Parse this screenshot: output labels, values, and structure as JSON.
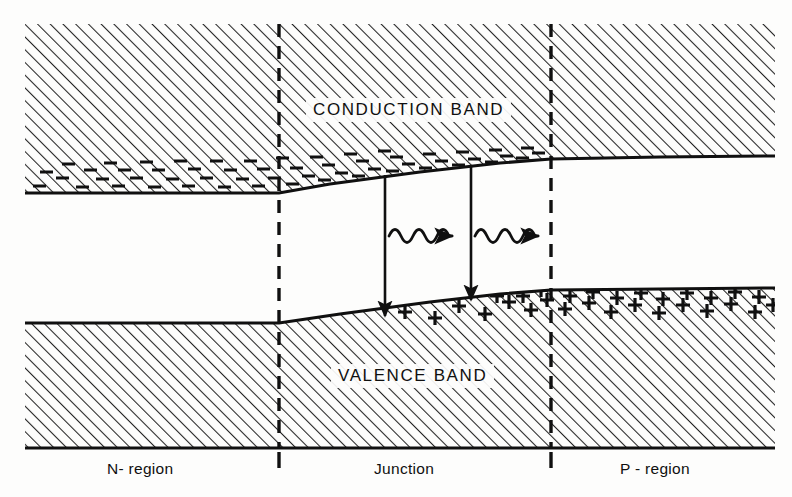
{
  "figure": {
    "type": "band-diagram",
    "canvas": {
      "width": 792,
      "height": 497
    },
    "colors": {
      "background": "#fdfdfc",
      "ink": "#101010",
      "hatch": "#2b2b2b"
    }
  },
  "labels": {
    "conduction_band": "CONDUCTION BAND",
    "valence_band": "VALENCE BAND",
    "n_region": "N- region",
    "junction": "Junction",
    "p_region": "P - region"
  },
  "diagram_data": {
    "type": "band-diagram",
    "x_bounds": [
      25,
      775
    ],
    "boundaries": {
      "n_junction_x": 279,
      "junction_p_x": 551
    },
    "conduction_band": {
      "fill": "hatched",
      "top_y": 24,
      "edge_points": [
        [
          25,
          193
        ],
        [
          279,
          193
        ],
        [
          330,
          184
        ],
        [
          420,
          172
        ],
        [
          500,
          163
        ],
        [
          551,
          159
        ],
        [
          660,
          157
        ],
        [
          775,
          156
        ]
      ],
      "carrier_symbol": "minus",
      "carrier_name": "electrons",
      "carrier_count": 74
    },
    "valence_band": {
      "fill": "hatched",
      "bottom_y": 448,
      "edge_points": [
        [
          25,
          323
        ],
        [
          279,
          323
        ],
        [
          340,
          314
        ],
        [
          430,
          302
        ],
        [
          500,
          294
        ],
        [
          551,
          290
        ],
        [
          660,
          289
        ],
        [
          775,
          288
        ]
      ],
      "carrier_symbol": "plus",
      "carrier_name": "holes",
      "carrier_count": 78
    },
    "recombination": [
      {
        "x_top": 385,
        "x_bottom": 385,
        "y_top": 175,
        "y_bottom": 318
      },
      {
        "x_top": 471,
        "x_bottom": 471,
        "y_top": 166,
        "y_bottom": 302
      }
    ],
    "photon_arrows": [
      {
        "x_start": 389,
        "x_end": 465,
        "y": 236,
        "waves": 3
      },
      {
        "x_start": 475,
        "x_end": 551,
        "y": 236,
        "waves": 3
      }
    ],
    "region_dividers": [
      {
        "x": 279,
        "style": "dashed",
        "y_top": 24,
        "y_bottom": 448
      },
      {
        "x": 551,
        "style": "dashed",
        "y_top": 24,
        "y_bottom": 448
      }
    ]
  }
}
